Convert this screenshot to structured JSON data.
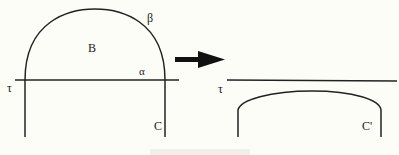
{
  "diagram": {
    "left": {
      "labels": {
        "tau": "τ",
        "beta_greek": "β",
        "B": "B",
        "alpha": "α",
        "C": "C"
      }
    },
    "right": {
      "labels": {
        "tau": "τ",
        "C_prime": "C'"
      }
    },
    "arrow": {
      "direction": "right"
    },
    "colors": {
      "stroke": "#222222",
      "background": "#fdfdf8"
    }
  }
}
